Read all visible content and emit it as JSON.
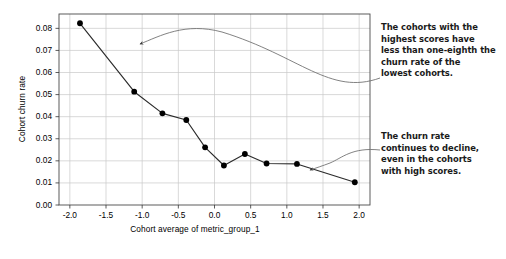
{
  "chart_data": {
    "type": "line",
    "title": "",
    "xlabel": "Cohort average of metric_group_1",
    "ylabel": "Cohort churn rate",
    "xlim": [
      -2.15,
      2.15
    ],
    "ylim": [
      0.0,
      0.0865
    ],
    "grid": true,
    "legend": "none",
    "marker": "filled-circle",
    "line_color": "#2b2b2b",
    "marker_color": "#000000",
    "grid_color": "#c8c8c8",
    "x": [
      -1.86,
      -1.11,
      -0.72,
      -0.39,
      -0.13,
      0.13,
      0.42,
      0.72,
      1.14,
      1.94
    ],
    "y": [
      0.0823,
      0.0513,
      0.0415,
      0.0385,
      0.0261,
      0.0179,
      0.0231,
      0.0188,
      0.0186,
      0.0103
    ],
    "xticks": [
      "-2.0",
      "-1.5",
      "-1.0",
      "-0.5",
      "0.0",
      "0.5",
      "1.0",
      "1.5",
      "2.0"
    ],
    "xtick_values": [
      -2.0,
      -1.5,
      -1.0,
      -0.5,
      0.0,
      0.5,
      1.0,
      1.5,
      2.0
    ],
    "yticks": [
      "0.00",
      "0.01",
      "0.02",
      "0.03",
      "0.04",
      "0.05",
      "0.06",
      "0.07",
      "0.08"
    ],
    "ytick_values": [
      0.0,
      0.01,
      0.02,
      0.03,
      0.04,
      0.05,
      0.06,
      0.07,
      0.08
    ]
  },
  "annotations": {
    "top": {
      "lines": [
        "The cohorts with the",
        "highest scores have",
        "less than one-eighth the",
        "churn rate of the",
        "lowest cohorts."
      ]
    },
    "bottom": {
      "lines": [
        "The churn rate",
        "continues to decline,",
        "even in the cohorts",
        "with high scores."
      ]
    }
  }
}
